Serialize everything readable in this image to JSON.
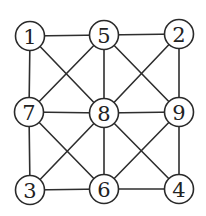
{
  "diagram": {
    "type": "graph",
    "directed": false,
    "node_radius": 14.5,
    "colors": {
      "edge": "#2e2e2e",
      "node_stroke": "#2a2a2a",
      "node_fill": "#ffffff",
      "label": "#222222",
      "background": "#ffffff"
    },
    "nodes": [
      {
        "id": "1",
        "label": "1",
        "x": 30,
        "y": 36
      },
      {
        "id": "5",
        "label": "5",
        "x": 104,
        "y": 35
      },
      {
        "id": "2",
        "label": "2",
        "x": 179,
        "y": 34
      },
      {
        "id": "7",
        "label": "7",
        "x": 29,
        "y": 112
      },
      {
        "id": "8",
        "label": "8",
        "x": 104,
        "y": 113
      },
      {
        "id": "9",
        "label": "9",
        "x": 179,
        "y": 112
      },
      {
        "id": "3",
        "label": "3",
        "x": 30,
        "y": 190
      },
      {
        "id": "6",
        "label": "6",
        "x": 104,
        "y": 189
      },
      {
        "id": "4",
        "label": "4",
        "x": 179,
        "y": 189
      }
    ],
    "edges": [
      [
        "1",
        "5"
      ],
      [
        "5",
        "2"
      ],
      [
        "7",
        "8"
      ],
      [
        "8",
        "9"
      ],
      [
        "3",
        "6"
      ],
      [
        "6",
        "4"
      ],
      [
        "1",
        "7"
      ],
      [
        "7",
        "3"
      ],
      [
        "5",
        "8"
      ],
      [
        "8",
        "6"
      ],
      [
        "2",
        "9"
      ],
      [
        "9",
        "4"
      ],
      [
        "1",
        "8"
      ],
      [
        "5",
        "7"
      ],
      [
        "5",
        "9"
      ],
      [
        "2",
        "8"
      ],
      [
        "7",
        "6"
      ],
      [
        "8",
        "3"
      ],
      [
        "8",
        "4"
      ],
      [
        "9",
        "6"
      ]
    ]
  }
}
